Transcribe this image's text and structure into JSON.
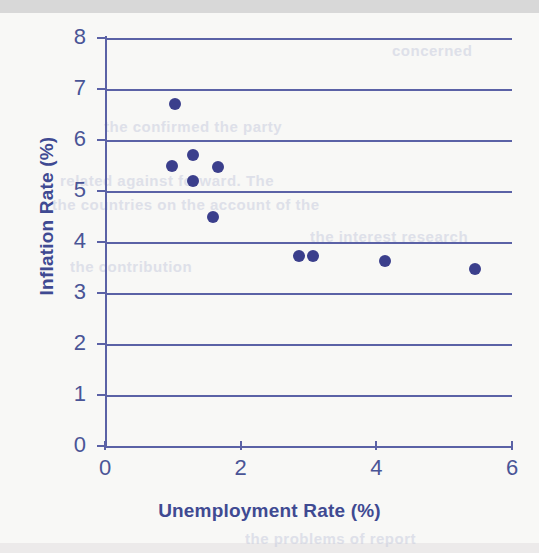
{
  "page": {
    "background_color": "#f8f8f6",
    "scan_band_color": "#d8d8d8",
    "bleed_through_lines": [
      {
        "text": "concerned",
        "x": 392,
        "y": 42
      },
      {
        "text": "the confirmed the party",
        "x": 104,
        "y": 118
      },
      {
        "text": "related against forward. The",
        "x": 60,
        "y": 172
      },
      {
        "text": "the countries on the account of the",
        "x": 52,
        "y": 196
      },
      {
        "text": "the interest research",
        "x": 310,
        "y": 228
      },
      {
        "text": "the contribution",
        "x": 70,
        "y": 258
      },
      {
        "text": "the problems of report",
        "x": 245,
        "y": 530
      }
    ]
  },
  "chart_data": {
    "type": "scatter",
    "title": "",
    "xlabel": "Unemployment Rate (%)",
    "ylabel": "Inflation Rate (%)",
    "xlim": [
      0,
      6
    ],
    "ylim": [
      0,
      8
    ],
    "xticks": [
      0,
      2,
      4,
      6
    ],
    "yticks": [
      0,
      1,
      2,
      3,
      4,
      5,
      6,
      7,
      8
    ],
    "grid": "horizontal",
    "legend": "none",
    "marker_color": "#3b3f8c",
    "axis_color": "#5b62a6",
    "label_color": "#3f4a92",
    "points": [
      {
        "x": 1.03,
        "y": 6.7
      },
      {
        "x": 1.3,
        "y": 5.71
      },
      {
        "x": 0.99,
        "y": 5.49
      },
      {
        "x": 1.67,
        "y": 5.47
      },
      {
        "x": 1.3,
        "y": 5.2
      },
      {
        "x": 1.59,
        "y": 4.49
      },
      {
        "x": 2.86,
        "y": 3.73
      },
      {
        "x": 3.07,
        "y": 3.73
      },
      {
        "x": 4.13,
        "y": 3.63
      },
      {
        "x": 5.46,
        "y": 3.47
      }
    ]
  }
}
